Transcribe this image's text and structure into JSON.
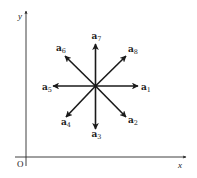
{
  "diagram": {
    "type": "vector-directions",
    "axes": {
      "x_label": "x",
      "y_label": "y",
      "origin_label": "O"
    },
    "center": "common origin point of eight unit vectors",
    "vectors": [
      {
        "name": "a",
        "sub": "1",
        "direction": "east",
        "angle_deg": 0
      },
      {
        "name": "a",
        "sub": "2",
        "direction": "south-east",
        "angle_deg": -45
      },
      {
        "name": "a",
        "sub": "3",
        "direction": "south",
        "angle_deg": -90
      },
      {
        "name": "a",
        "sub": "4",
        "direction": "south-west",
        "angle_deg": -135
      },
      {
        "name": "a",
        "sub": "5",
        "direction": "west",
        "angle_deg": 180
      },
      {
        "name": "a",
        "sub": "6",
        "direction": "north-west",
        "angle_deg": 135
      },
      {
        "name": "a",
        "sub": "7",
        "direction": "north",
        "angle_deg": 90
      },
      {
        "name": "a",
        "sub": "8",
        "direction": "north-east",
        "angle_deg": 45
      }
    ],
    "colors": {
      "stroke": "#1a1a1a",
      "background": "#ffffff"
    }
  }
}
